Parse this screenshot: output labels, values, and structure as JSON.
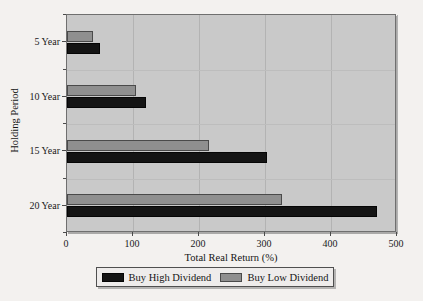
{
  "chart_data": {
    "type": "bar",
    "orientation": "horizontal",
    "title": "",
    "xlabel": "Total Real Return (%)",
    "ylabel": "Holding Period",
    "categories": [
      "5 Year",
      "10 Year",
      "15 Year",
      "20 Year"
    ],
    "xlim": [
      0,
      500
    ],
    "xticks": [
      0,
      100,
      200,
      300,
      400,
      500
    ],
    "xticklabels": [
      "0",
      "100",
      "200",
      "300",
      "400",
      "500"
    ],
    "grid": true,
    "legend_position": "bottom",
    "series": [
      {
        "name": "Buy High Dividend",
        "color": "#141414",
        "values": [
          50,
          120,
          303,
          470
        ]
      },
      {
        "name": "Buy Low Dividend",
        "color": "#8f8f8f",
        "values": [
          40,
          105,
          215,
          325
        ]
      }
    ],
    "colors": {
      "plot_background": "#c9c9c9",
      "page_background": "#f3f1ef",
      "high_dividend": "#141414",
      "low_dividend": "#8f8f8f",
      "axis": "#4a4a4a",
      "gridline": "#b3b3b3"
    }
  }
}
